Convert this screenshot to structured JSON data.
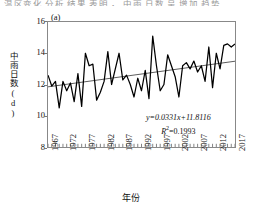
{
  "cropped_header_text": "温区变化 分析 结果 表明 ， 中雨 日数 呈 增加 趋势",
  "panel_label": "(a)",
  "axis": {
    "y_title": "中雨日数(d)",
    "x_title": "年份",
    "y_ticks": [
      "8",
      "10",
      "12",
      "14",
      "16"
    ],
    "x_ticks": [
      "1967",
      "1972",
      "1977",
      "1982",
      "1987",
      "1992",
      "1997",
      "2002",
      "2007",
      "2012",
      "2017"
    ]
  },
  "annotation": {
    "equation": "y=0.0331x+11.8116",
    "r_squared_label": "R",
    "r_squared_exp": "2",
    "r_squared_value": "=0.1993"
  },
  "colors": {
    "series_line": "#000000",
    "trend_line": "#333333",
    "frame": "#888888"
  },
  "chart_data": {
    "type": "line",
    "title": "",
    "xlabel": "年份",
    "ylabel": "中雨日数(d)",
    "xlim": [
      1967,
      2017
    ],
    "ylim": [
      8,
      16
    ],
    "ytick_interval": 2,
    "xtick_interval": 5,
    "grid": false,
    "legend": "none",
    "x": [
      1967,
      1968,
      1969,
      1970,
      1971,
      1972,
      1973,
      1974,
      1975,
      1976,
      1977,
      1978,
      1979,
      1980,
      1981,
      1982,
      1983,
      1984,
      1985,
      1986,
      1987,
      1988,
      1989,
      1990,
      1991,
      1992,
      1993,
      1994,
      1995,
      1996,
      1997,
      1998,
      1999,
      2000,
      2001,
      2002,
      2003,
      2004,
      2005,
      2006,
      2007,
      2008,
      2009,
      2010,
      2011,
      2012,
      2013,
      2014,
      2015,
      2016,
      2017
    ],
    "series": [
      {
        "name": "中雨日数",
        "values": [
          12.6,
          11.9,
          12.2,
          10.5,
          12.2,
          11.6,
          12.1,
          10.9,
          12.7,
          10.6,
          14.0,
          13.2,
          13.3,
          11.0,
          11.5,
          12.2,
          14.1,
          12.0,
          13.0,
          14.0,
          12.3,
          12.6,
          12.0,
          11.2,
          12.4,
          11.6,
          12.9,
          11.1,
          15.1,
          13.2,
          11.6,
          12.0,
          13.9,
          13.2,
          12.5,
          11.2,
          13.2,
          13.4,
          13.0,
          13.5,
          12.8,
          13.2,
          12.2,
          14.4,
          11.8,
          14.0,
          13.0,
          14.5,
          14.6,
          14.4,
          14.6
        ]
      },
      {
        "name": "线性趋势线",
        "type": "trend",
        "equation": "y=0.0331x+11.8116",
        "r_squared": 0.1993,
        "y_start": 11.85,
        "y_end": 13.49
      }
    ]
  }
}
